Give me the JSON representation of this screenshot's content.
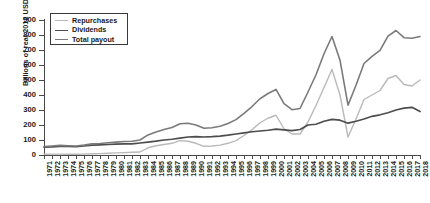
{
  "chart_data": {
    "type": "line",
    "title": "",
    "xlabel": "",
    "ylabel": "Billions of real 2012 USD",
    "ylim": [
      0,
      900
    ],
    "ytickstep": 100,
    "grid": false,
    "legend_position": "top-left",
    "yticks": [
      0,
      100,
      200,
      300,
      400,
      500,
      600,
      700,
      800,
      900
    ],
    "categories": [
      "1971",
      "1972",
      "1973",
      "1974",
      "1975",
      "1976",
      "1977",
      "1978",
      "1979",
      "1980",
      "1981",
      "1982",
      "1983",
      "1984",
      "1985",
      "1986",
      "1987",
      "1988",
      "1989",
      "1990",
      "1991",
      "1992",
      "1993",
      "1994",
      "1995",
      "1996",
      "1997",
      "1998",
      "1999",
      "2000",
      "2001",
      "2002",
      "2003",
      "2004",
      "2005",
      "2006",
      "2007",
      "2008",
      "2009",
      "2010",
      "2011",
      "2012",
      "2013",
      "2014",
      "2015",
      "2016",
      "2017",
      "2018"
    ],
    "series": [
      {
        "name": "Repurchases",
        "color": "#b9b9b9",
        "width": 1.4,
        "values": [
          5,
          6,
          6,
          5,
          5,
          6,
          8,
          9,
          12,
          14,
          16,
          18,
          20,
          48,
          62,
          70,
          78,
          96,
          92,
          78,
          58,
          60,
          66,
          78,
          96,
          130,
          168,
          215,
          245,
          265,
          175,
          140,
          140,
          220,
          330,
          450,
          570,
          400,
          120,
          240,
          370,
          400,
          430,
          510,
          530,
          470,
          460,
          500
        ]
      },
      {
        "name": "Dividends",
        "color": "#4d4d4d",
        "width": 1.7,
        "values": [
          52,
          54,
          58,
          57,
          55,
          60,
          66,
          68,
          70,
          72,
          74,
          74,
          80,
          86,
          92,
          100,
          105,
          112,
          120,
          122,
          120,
          122,
          126,
          132,
          140,
          148,
          155,
          160,
          165,
          172,
          168,
          162,
          170,
          200,
          205,
          225,
          238,
          232,
          212,
          225,
          240,
          258,
          268,
          282,
          300,
          312,
          318,
          290
        ]
      },
      {
        "name": "Total payout",
        "color": "#7a7a7a",
        "width": 1.6,
        "values": [
          57,
          60,
          64,
          62,
          60,
          66,
          74,
          77,
          82,
          86,
          90,
          92,
          100,
          134,
          154,
          170,
          183,
          208,
          212,
          200,
          178,
          182,
          192,
          210,
          236,
          278,
          323,
          375,
          410,
          437,
          343,
          302,
          310,
          420,
          535,
          675,
          790,
          632,
          332,
          465,
          610,
          658,
          698,
          792,
          830,
          782,
          778,
          790
        ]
      }
    ],
    "legend": [
      {
        "label": "Repurchases",
        "color": "#b9b9b9",
        "width": 1.4
      },
      {
        "label": "Dividends",
        "color": "#4d4d4d",
        "width": 1.9
      },
      {
        "label": "Total payout",
        "color": "#7a7a7a",
        "width": 1.6
      }
    ]
  }
}
